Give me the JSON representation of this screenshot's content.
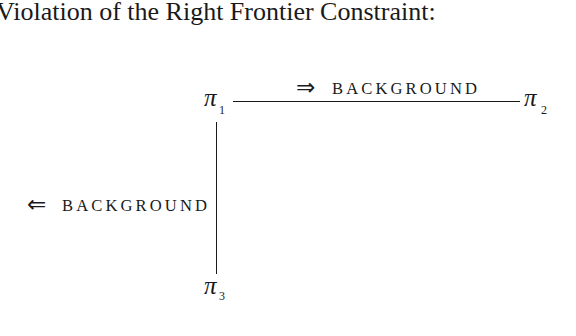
{
  "title": "Violation of the Right Frontier Constraint:",
  "diagram": {
    "nodes": [
      {
        "id": "pi1",
        "symbol": "π",
        "subscript": "1"
      },
      {
        "id": "pi2",
        "symbol": "π",
        "subscript": "2"
      },
      {
        "id": "pi3",
        "symbol": "π",
        "subscript": "3"
      }
    ],
    "edges": [
      {
        "from": "pi1",
        "to": "pi2",
        "orientation": "horizontal",
        "arrow": "⇒",
        "label": "BACKGROUND"
      },
      {
        "from": "pi1",
        "to": "pi3",
        "orientation": "vertical",
        "arrow": "⇐",
        "label": "BACKGROUND"
      }
    ]
  },
  "colors": {
    "text": "#1a1a1a",
    "background": "#ffffff"
  }
}
